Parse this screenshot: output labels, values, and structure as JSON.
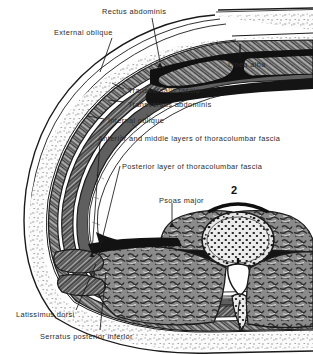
{
  "figure": {
    "plate_number": "2",
    "style": "engraved anatomical line drawing, black and white halftone"
  },
  "labels": [
    {
      "id": "rectus-abdominis",
      "text": "Rectus abdominis",
      "x": 102,
      "y": 8,
      "leader": [
        [
          152,
          18
        ],
        [
          160,
          62
        ]
      ]
    },
    {
      "id": "external-oblique",
      "text": "External oblique",
      "x": 54,
      "y": 29,
      "leader": [
        [
          112,
          38
        ],
        [
          100,
          72
        ]
      ]
    },
    {
      "id": "linea-alba",
      "text": "Linea alba",
      "x": 228,
      "y": 61,
      "leader": [
        [
          240,
          58
        ],
        [
          240,
          43
        ]
      ]
    },
    {
      "id": "transversalis-fascia",
      "text": "Transversalis fascia",
      "x": 128,
      "y": 87,
      "leader": [
        [
          124,
          89
        ],
        [
          112,
          83
        ]
      ]
    },
    {
      "id": "transversus-abdominis",
      "text": "Transversus abdominis",
      "x": 128,
      "y": 101,
      "leader": [
        [
          124,
          102
        ],
        [
          108,
          100
        ]
      ]
    },
    {
      "id": "internal-oblique",
      "text": "Internal oblique",
      "x": 108,
      "y": 117,
      "leader": [
        [
          104,
          119
        ],
        [
          88,
          116
        ]
      ]
    },
    {
      "id": "ant-mid-tlf",
      "text": "Anterior and middle layers of thoracolumbar fascia",
      "x": 98,
      "y": 135,
      "leader": [
        [
          100,
          142
        ],
        [
          92,
          252
        ]
      ]
    },
    {
      "id": "posterior-tlf",
      "text": "Posterior layer of thoracolumbar fascia",
      "x": 122,
      "y": 163,
      "leader": [
        [
          120,
          166
        ],
        [
          100,
          248
        ]
      ]
    },
    {
      "id": "psoas-major",
      "text": "Psoas major",
      "x": 159,
      "y": 197,
      "leader": [
        [
          172,
          203
        ],
        [
          172,
          222
        ]
      ]
    },
    {
      "id": "latissimus-dorsi",
      "text": "Latissimus dorsi",
      "x": 16,
      "y": 311,
      "leader": [
        [
          76,
          310
        ],
        [
          96,
          264
        ]
      ]
    },
    {
      "id": "serratus-post-inf",
      "text": "Serratus posterior inferior",
      "x": 40,
      "y": 333,
      "leader": [
        [
          100,
          330
        ],
        [
          106,
          272
        ]
      ]
    }
  ],
  "structures": [
    {
      "id": "skin",
      "name": "skin",
      "layer": 1
    },
    {
      "id": "subcutaneous-fat",
      "name": "subcutaneous fat",
      "layer": 2
    },
    {
      "id": "external-oblique-muscle",
      "name": "external oblique muscle",
      "layer": 3
    },
    {
      "id": "internal-oblique-muscle",
      "name": "internal oblique muscle",
      "layer": 4
    },
    {
      "id": "transversus-muscle",
      "name": "transversus abdominis muscle",
      "layer": 5
    },
    {
      "id": "transversalis-fascia",
      "name": "transversalis fascia",
      "layer": 6
    },
    {
      "id": "rectus-muscle-left",
      "name": "rectus abdominis (left)",
      "layer": 3
    },
    {
      "id": "rectus-muscle-right",
      "name": "rectus abdominis (right)",
      "layer": 3
    },
    {
      "id": "linea-alba-gap",
      "name": "linea alba",
      "layer": 3
    },
    {
      "id": "psoas-muscle",
      "name": "psoas major muscle",
      "layer": 7
    },
    {
      "id": "vertebral-body",
      "name": "second lumbar vertebral body",
      "layer": 8
    },
    {
      "id": "vertebral-canal",
      "name": "vertebral canal",
      "layer": 8
    },
    {
      "id": "erector-spinae",
      "name": "erector spinae muscle mass",
      "layer": 7
    },
    {
      "id": "latissimus-sheet",
      "name": "latissimus dorsi",
      "layer": 3
    },
    {
      "id": "serratus-sheet",
      "name": "serratus posterior inferior",
      "layer": 3
    }
  ],
  "colors": {
    "ink": "#1a1a1a",
    "label_text": "#2b2b2b",
    "muscle_light": "#9a9a9a",
    "muscle_mid": "#6f6f6f",
    "muscle_dark": "#4a4a4a",
    "fat": "#f2f2f2",
    "bone": "#d8d8d8",
    "background": "#ffffff"
  }
}
